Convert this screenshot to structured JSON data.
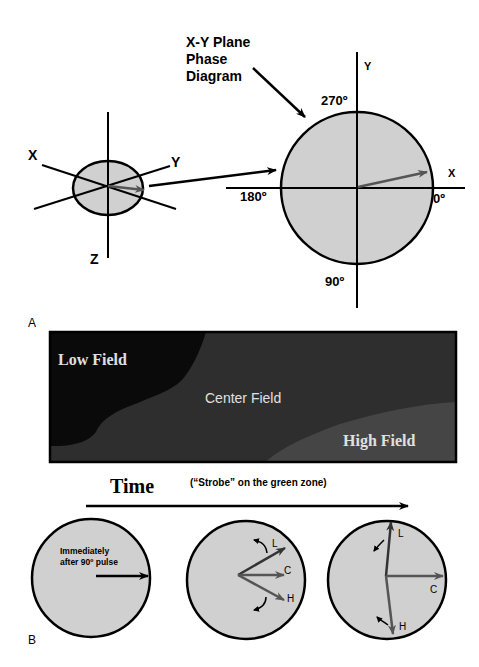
{
  "panel_a": {
    "label": "A",
    "title_lines": [
      "X-Y Plane",
      "Phase",
      "Diagram"
    ],
    "small_axes": {
      "x": "X",
      "y": "Y",
      "z": "Z"
    },
    "phase_circle": {
      "y_axis": "Y",
      "x_axis": "X",
      "deg_270": "270º",
      "deg_180": "180º",
      "deg_0": "0º",
      "deg_90": "90º"
    }
  },
  "field_map": {
    "low": "Low Field",
    "center": "Center Field",
    "high": "High Field"
  },
  "panel_b": {
    "label": "B",
    "time_label": "Time",
    "strobe_label": "(“Strobe” on the green zone)",
    "circle1_text_line1": "Immediately",
    "circle1_text_line2": "after 90º pulse",
    "vector_labels": {
      "low": "L",
      "center": "C",
      "high": "H"
    }
  },
  "colors": {
    "fill_gray": "#d0d0d0",
    "vector_gray": "#555555",
    "low_field": "#0a0a0a",
    "center_field": "#2e2e2e",
    "high_field": "#454545",
    "outline": "#000000"
  }
}
